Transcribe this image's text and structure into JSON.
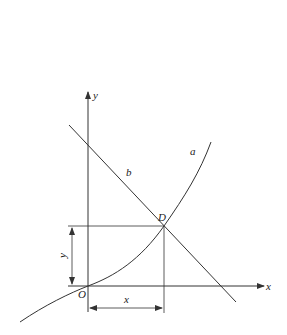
{
  "diagram": {
    "type": "function-graph",
    "colors": {
      "line": "#333333",
      "background": "#ffffff"
    },
    "axes": {
      "x_label": "x",
      "y_label": "y",
      "origin_label": "O"
    },
    "curves": [
      {
        "id": "a",
        "label": "a",
        "kind": "increasing convex curve through origin"
      },
      {
        "id": "b",
        "label": "b",
        "kind": "decreasing straight line"
      }
    ],
    "intersection": {
      "label": "D"
    },
    "dimensions": {
      "horizontal_label": "x",
      "vertical_label": "y"
    }
  }
}
